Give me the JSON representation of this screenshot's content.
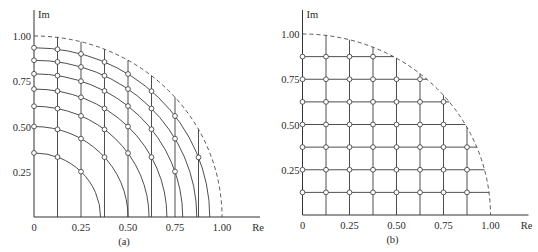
{
  "figure": {
    "panels": [
      {
        "id": "a",
        "caption": "(a)",
        "kind": "equal-area-rings",
        "origin_px": [
          34,
          217
        ],
        "scale_px": [
          188,
          181
        ],
        "x_axis_label": "Re",
        "y_axis_label": "Im",
        "x_ticks": [
          "0",
          "0.25",
          "0.50",
          "0.75",
          "1.00"
        ],
        "x_tick_values": [
          0,
          0.25,
          0.5,
          0.75,
          1.0
        ],
        "y_ticks": [
          "0.25",
          "0.50",
          "0.75",
          "1.00"
        ],
        "y_tick_values": [
          0.25,
          0.5,
          0.75,
          1.0
        ],
        "ring_radii": [
          0.354,
          0.5,
          0.612,
          0.707,
          0.791,
          0.866,
          0.935
        ],
        "vertical_lines_x": [
          0.125,
          0.25,
          0.375,
          0.5,
          0.625,
          0.75,
          0.875
        ],
        "unit_circle": "dashed"
      },
      {
        "id": "b",
        "caption": "(b)",
        "kind": "rectangular-grid",
        "origin_px": [
          302.5,
          215
        ],
        "scale_px": [
          188,
          181
        ],
        "x_axis_label": "Re",
        "y_axis_label": "Im",
        "x_ticks": [
          "0",
          "0.25",
          "0.50",
          "0.75",
          "1.00"
        ],
        "x_tick_values": [
          0,
          0.25,
          0.5,
          0.75,
          1.0
        ],
        "y_ticks": [
          "0.25",
          "0.50",
          "0.75",
          "1.00"
        ],
        "y_tick_values": [
          0.25,
          0.5,
          0.75,
          1.0
        ],
        "vertical_lines_x": [
          0.125,
          0.25,
          0.375,
          0.5,
          0.625,
          0.75,
          0.875
        ],
        "horizontal_lines_y": [
          0.125,
          0.25,
          0.375,
          0.5,
          0.625,
          0.75,
          0.875
        ],
        "unit_circle": "dashed"
      }
    ]
  }
}
